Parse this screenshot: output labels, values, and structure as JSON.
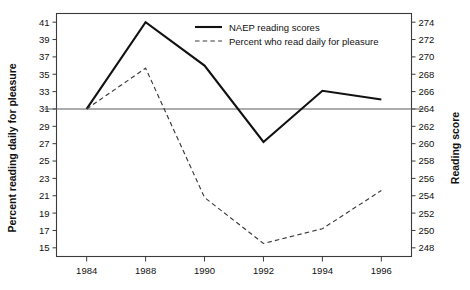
{
  "chart_data": {
    "type": "line",
    "title": "",
    "subtitle": "",
    "xlabel": "",
    "ylabel": "Percent reading daily for pleasure",
    "y2label": "Reading score",
    "categories": [
      "1984",
      "1988",
      "1990",
      "1992",
      "1994",
      "1996"
    ],
    "x": [
      1984,
      1988,
      1990,
      1992,
      1994,
      1996
    ],
    "x_spacing": "categorical-even",
    "grid": false,
    "legend_position": "top-center",
    "ylim": [
      14,
      42
    ],
    "y2lim": [
      247,
      275
    ],
    "yticks": [
      15,
      17,
      19,
      21,
      23,
      25,
      27,
      29,
      31,
      33,
      35,
      37,
      39,
      41
    ],
    "ytick_labels": [
      "15",
      "17",
      "19",
      "21",
      "23",
      "25",
      "27",
      "29",
      "31",
      "33",
      "35",
      "37",
      "39",
      "41"
    ],
    "y2ticks": [
      248,
      250,
      252,
      254,
      256,
      258,
      260,
      262,
      264,
      266,
      268,
      270,
      272,
      274
    ],
    "y2tick_labels": [
      "248",
      "250",
      "252",
      "254",
      "256",
      "258",
      "260",
      "262",
      "264",
      "266",
      "268",
      "270",
      "272",
      "274"
    ],
    "xtick_labels": [
      "1984",
      "1988",
      "1990",
      "1992",
      "1994",
      "1996"
    ],
    "reference_line": {
      "left_value": 31,
      "right_value": 264,
      "style": "solid"
    },
    "series": [
      {
        "name": "NAEP reading scores",
        "axis": "right",
        "style": "solid",
        "color": "#111111",
        "values": [
          264.0,
          274.0,
          269.0,
          260.2,
          266.1,
          265.1
        ],
        "values_on_left_scale": [
          31.0,
          41.0,
          36.0,
          27.2,
          33.1,
          32.1
        ]
      },
      {
        "name": "Percent who read daily for pleasure",
        "axis": "left",
        "style": "dashed",
        "color": "#3a3a3a",
        "values": [
          31.0,
          35.7,
          20.8,
          15.5,
          17.2,
          21.6
        ]
      }
    ],
    "annotations": []
  },
  "legend": {
    "entries": [
      {
        "label": "NAEP reading scores",
        "style": "solid"
      },
      {
        "label": "Percent who read daily for pleasure",
        "style": "dashed"
      }
    ]
  },
  "axes": {
    "left_title": "Percent reading daily for pleasure",
    "right_title": "Reading score"
  }
}
